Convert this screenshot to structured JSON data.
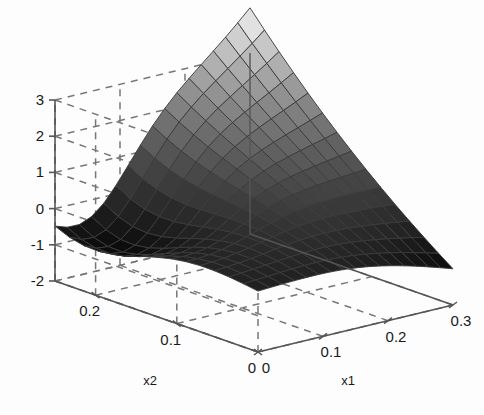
{
  "figure": {
    "type": "surface-3d-plot",
    "background_color": "#fdfdfd",
    "axis_line_color": "#555555",
    "grid_color": "#777777",
    "grid_style": "dashed",
    "mesh_line_color": "#3a3a3a",
    "colormap": "gray",
    "surface_light": "#d9d9d9",
    "surface_dark": "#0d0d0d"
  },
  "axes": {
    "z": {
      "label": "",
      "ticks": [
        "3",
        "2",
        "1",
        "0",
        "-1",
        "-2"
      ],
      "tick_values": [
        3,
        2,
        1,
        0,
        -1,
        -2
      ],
      "range": [
        -2,
        3
      ]
    },
    "x1": {
      "label": "x1",
      "ticks": [
        "0",
        "0.1",
        "0.2",
        "0.3"
      ],
      "tick_values": [
        0,
        0.1,
        0.2,
        0.3
      ],
      "range": [
        0,
        0.3
      ]
    },
    "x2": {
      "label": "x2",
      "ticks": [
        "0",
        "0.1",
        "0.2"
      ],
      "tick_values": [
        0,
        0.1,
        0.2
      ],
      "range": [
        0,
        0.25
      ]
    }
  },
  "chart_data": {
    "type": "surface",
    "title": "",
    "xlabel": "x1",
    "ylabel": "x2",
    "zlabel": "",
    "xlim": [
      0,
      0.3
    ],
    "ylim": [
      0,
      0.25
    ],
    "zlim": [
      -2,
      3
    ],
    "grid": true,
    "legend": "none",
    "colormap": "gray",
    "mesh_nx": 16,
    "mesh_ny": 14,
    "features": [
      {
        "name": "peak",
        "x1": 0.3,
        "x2": 0.25,
        "z": 3.0
      },
      {
        "name": "valley-minimum",
        "x1": 0.05,
        "x2": 0.22,
        "z": -2.0
      },
      {
        "name": "left-corner",
        "x1": 0.0,
        "x2": 0.25,
        "z": 0.8
      },
      {
        "name": "right-corner",
        "x1": 0.3,
        "x2": 0.0,
        "z": -1.0
      },
      {
        "name": "front-origin",
        "x1": 0.0,
        "x2": 0.0,
        "z": -0.3
      }
    ],
    "corner_values": {
      "x1_0_x2_0": -0.3,
      "x1_0.3_x2_0": -1.0,
      "x1_0_x2_0.25": 0.8,
      "x1_0.3_x2_0.25": 3.0
    }
  }
}
